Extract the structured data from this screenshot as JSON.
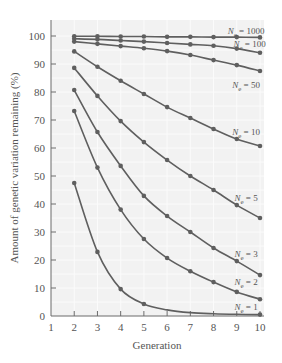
{
  "chart_data": {
    "type": "line",
    "title": "",
    "xlabel": "Generation",
    "ylabel": "Amount of genetic variation remaining (%)",
    "xlim": [
      1,
      10
    ],
    "ylim": [
      0,
      105
    ],
    "x_ticks": [
      1,
      2,
      3,
      4,
      5,
      6,
      7,
      8,
      9,
      10
    ],
    "y_ticks": [
      0,
      10,
      20,
      30,
      40,
      50,
      60,
      70,
      80,
      90,
      100
    ],
    "grid": true,
    "legend": "inline labels at right end of each line",
    "x": [
      2,
      3,
      4,
      5,
      6,
      7,
      8,
      9,
      10
    ],
    "series": [
      {
        "name": "Ne = 1000",
        "label_main": "N",
        "label_sub": "e",
        "label_rest": " = 1000",
        "values": [
          99.9,
          99.9,
          99.8,
          99.8,
          99.7,
          99.7,
          99.6,
          99.6,
          99.5
        ]
      },
      {
        "name": "Ne = 100",
        "label_main": "N",
        "label_sub": "e",
        "label_rest": " = 100",
        "values": [
          99.0,
          98.8,
          98.4,
          98.0,
          97.5,
          97.0,
          96.5,
          95.5,
          94.0
        ]
      },
      {
        "name": "Ne = 50",
        "label_main": "N",
        "label_sub": "e",
        "label_rest": " = 50",
        "values": [
          98.0,
          97.2,
          96.4,
          95.6,
          94.6,
          93.2,
          91.4,
          89.6,
          87.5
        ]
      },
      {
        "name": "Ne = 10",
        "label_main": "N",
        "label_sub": "e",
        "label_rest": " = 10",
        "values": [
          94.5,
          89.0,
          84.0,
          79.3,
          74.6,
          70.7,
          66.8,
          63.2,
          60.7
        ]
      },
      {
        "name": "Ne = 5",
        "label_main": "N",
        "label_sub": "e",
        "label_rest": " = 5",
        "values": [
          88.6,
          78.6,
          69.6,
          62.1,
          55.7,
          50.0,
          45.0,
          39.6,
          35.0
        ]
      },
      {
        "name": "Ne = 3",
        "label_main": "N",
        "label_sub": "e",
        "label_rest": " = 3",
        "values": [
          80.7,
          65.7,
          53.6,
          42.9,
          35.7,
          30.0,
          24.3,
          19.6,
          14.6
        ]
      },
      {
        "name": "Ne = 2",
        "label_main": "N",
        "label_sub": "e",
        "label_rest": " = 2",
        "values": [
          73.2,
          53.0,
          38.0,
          27.5,
          20.7,
          16.0,
          12.1,
          8.6,
          6.0
        ]
      },
      {
        "name": "Ne = 1",
        "label_main": "N",
        "label_sub": "e",
        "label_rest": " = 1",
        "values": [
          47.5,
          22.9,
          9.6,
          4.3,
          2.2,
          1.2,
          0.8,
          0.6,
          0.5
        ]
      }
    ],
    "label_positions": [
      {
        "x": 9.4,
        "y": 100.8
      },
      {
        "x": 9.55,
        "y": 96.2
      },
      {
        "x": 9.4,
        "y": 81.5
      },
      {
        "x": 9.4,
        "y": 64.5
      },
      {
        "x": 9.4,
        "y": 41.2
      },
      {
        "x": 9.4,
        "y": 21.2
      },
      {
        "x": 9.4,
        "y": 11.2
      },
      {
        "x": 9.4,
        "y": 2.2
      }
    ],
    "colors": {
      "line": "#5f5f5f",
      "marker": "#5f5f5f",
      "plot_bg": "#f2f2f2",
      "grid": "#fbfbfb",
      "axis": "#6a6a6a"
    }
  }
}
